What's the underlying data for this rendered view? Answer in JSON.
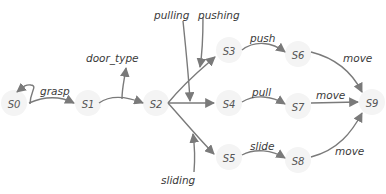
{
  "diagram": {
    "type": "state-transition-graph",
    "nodes": [
      {
        "id": "S0",
        "label": "S0"
      },
      {
        "id": "S1",
        "label": "S1"
      },
      {
        "id": "S2",
        "label": "S2"
      },
      {
        "id": "S3",
        "label": "S3"
      },
      {
        "id": "S4",
        "label": "S4"
      },
      {
        "id": "S5",
        "label": "S5"
      },
      {
        "id": "S6",
        "label": "S6"
      },
      {
        "id": "S7",
        "label": "S7"
      },
      {
        "id": "S8",
        "label": "S8"
      },
      {
        "id": "S9",
        "label": "S9"
      }
    ],
    "edges": [
      {
        "from": "S0",
        "to": "S1",
        "label": "grasp"
      },
      {
        "from": "S1",
        "to": "S2",
        "label": ""
      },
      {
        "from": "S2",
        "to": "S3",
        "label": ""
      },
      {
        "from": "S2",
        "to": "S4",
        "label": ""
      },
      {
        "from": "S2",
        "to": "S5",
        "label": ""
      },
      {
        "from": "S3",
        "to": "S6",
        "label": "push"
      },
      {
        "from": "S4",
        "to": "S7",
        "label": "pull"
      },
      {
        "from": "S5",
        "to": "S8",
        "label": "slide"
      },
      {
        "from": "S6",
        "to": "S9",
        "label": "move"
      },
      {
        "from": "S7",
        "to": "S9",
        "label": "move"
      },
      {
        "from": "S8",
        "to": "S9",
        "label": "move"
      }
    ],
    "annotations": {
      "self_loop_grasp": "grasp",
      "door_type": "door_type",
      "pulling": "pulling",
      "pushing": "pushing",
      "sliding": "sliding"
    }
  }
}
